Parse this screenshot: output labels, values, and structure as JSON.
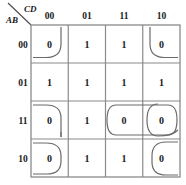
{
  "kmap": {
    "title": "Karnaugh map 4-variable",
    "corner": {
      "top_label": "CD",
      "bottom_label": "AB",
      "top_label_name": "cd-axis-label",
      "bottom_label_name": "ab-axis-label"
    },
    "column_headers": [
      "00",
      "01",
      "11",
      "10"
    ],
    "row_headers": [
      "00",
      "01",
      "11",
      "10"
    ],
    "cells": [
      [
        "0",
        "1",
        "1",
        "0"
      ],
      [
        "1",
        "1",
        "1",
        "1"
      ],
      [
        "0",
        "1",
        "0",
        "0"
      ],
      [
        "0",
        "1",
        "1",
        "0"
      ]
    ],
    "colors": {
      "line": "#808080",
      "loop": "#6b6b6b",
      "text": "#1a1a1a",
      "background": "#ffffff"
    },
    "groups": [
      {
        "name": "group-corners-top-left",
        "cells": "AB=00,CD=00"
      },
      {
        "name": "group-corners-top-right",
        "cells": "AB=00,CD=10"
      },
      {
        "name": "group-left-column-pair",
        "cells": "AB=11/10,CD=00"
      },
      {
        "name": "group-row11-right-pair",
        "cells": "AB=11,CD=11/10"
      },
      {
        "name": "group-right-column-pair",
        "cells": "AB=11/10,CD=10"
      }
    ]
  }
}
